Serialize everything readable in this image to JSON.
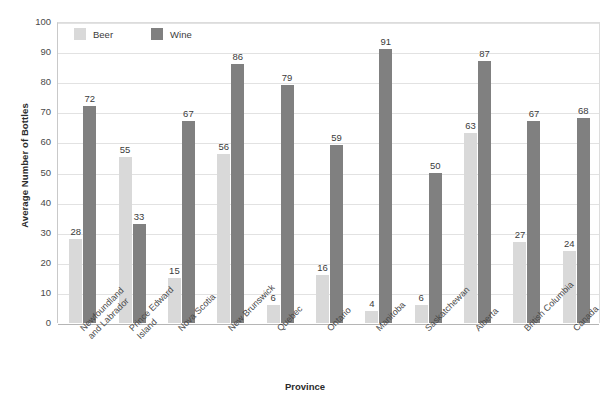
{
  "chart_data": {
    "type": "bar",
    "title": "",
    "xlabel": "Province",
    "ylabel": "Average Number of Bottles",
    "ylim": [
      0,
      100
    ],
    "ytick_step": 10,
    "yticks": [
      0,
      10,
      20,
      30,
      40,
      50,
      60,
      70,
      80,
      90,
      100
    ],
    "grid": true,
    "legend_position": "top-left-inside",
    "categories": [
      "Newfoundland\nand Labrador",
      "Prince Edward\nIsland",
      "Nova Scotia",
      "New Brunswick",
      "Quebec",
      "Ontario",
      "Manitoba",
      "Saskatchewan",
      "Alberta",
      "British Columbia",
      "Canada"
    ],
    "series": [
      {
        "name": "Beer",
        "color": "#d9d9d9",
        "values": [
          28,
          55,
          15,
          56,
          6,
          16,
          4,
          6,
          63,
          27,
          24
        ]
      },
      {
        "name": "Wine",
        "color": "#808080",
        "values": [
          72,
          33,
          67,
          86,
          79,
          59,
          91,
          50,
          87,
          67,
          68
        ]
      }
    ]
  },
  "colors": {
    "beer": "#d9d9d9",
    "wine": "#808080",
    "grid": "#e2e2e2",
    "axis": "#b5b5b5",
    "text": "#3b3b3b",
    "background": "#ffffff"
  }
}
